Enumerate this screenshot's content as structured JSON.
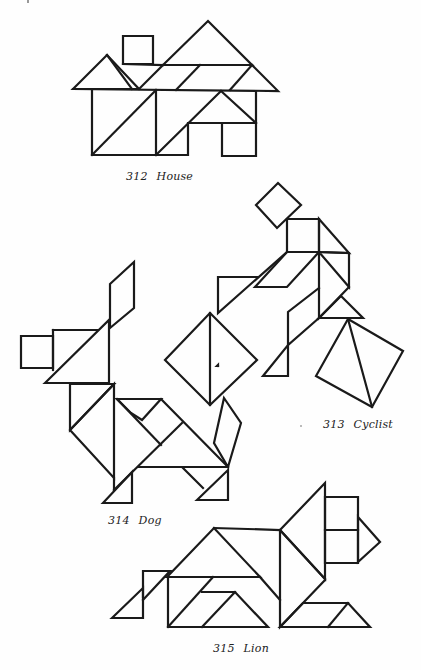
{
  "figures": [
    {
      "id": "house",
      "number": "312",
      "title": "House"
    },
    {
      "id": "cyclist",
      "number": "313",
      "title": "Cyclist"
    },
    {
      "id": "dog",
      "number": "314",
      "title": "Dog"
    },
    {
      "id": "lion",
      "number": "315",
      "title": "Lion"
    }
  ],
  "style": {
    "line_color": "#1a1a1a",
    "background": "#fefefe"
  }
}
